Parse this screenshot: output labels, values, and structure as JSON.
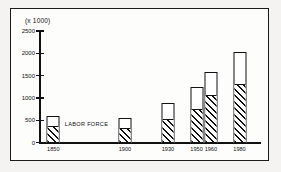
{
  "chart_data": {
    "type": "bar",
    "title": "",
    "subtitle": "",
    "xlabel": "",
    "ylabel": "(x 1000)",
    "unit_caption": "(x 1000)",
    "categories": [
      "1850",
      "1900",
      "1930",
      "1950",
      "1960",
      "1980"
    ],
    "x_positions": [
      1850,
      1900,
      1930,
      1950,
      1960,
      1980
    ],
    "ylim": [
      0,
      2500
    ],
    "yticks": [
      0,
      500,
      1000,
      1500,
      2000,
      2500
    ],
    "ytick_labels": [
      "0",
      "500",
      "1000",
      "1500",
      "2000",
      "2500"
    ],
    "grid": false,
    "legend_position": "inline-annotation",
    "annotations": [
      {
        "text": "LABOR FORCE",
        "refers_to": "hatched lower segment",
        "attached_to_category": "1850"
      }
    ],
    "series": [
      {
        "name": "LABOR FORCE",
        "fill": "diagonal-hatch",
        "values": [
          400,
          350,
          540,
          760,
          1080,
          1320
        ]
      },
      {
        "name": "Total",
        "fill": "white",
        "values": [
          600,
          570,
          900,
          1250,
          1600,
          2050
        ]
      }
    ]
  },
  "figure": {
    "background_color": "#f4f3f1",
    "panel_color": "#fdfdfc",
    "border_color": "#1a1a1a",
    "ink_color": "#111111"
  }
}
